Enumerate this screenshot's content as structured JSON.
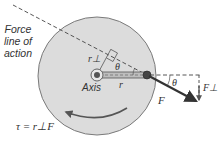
{
  "diagram": {
    "labels": {
      "line_of_action": [
        "Force",
        "line of",
        "action"
      ],
      "axis": "Axis",
      "r_perp": "r⊥",
      "r": "r",
      "theta_inner": "θ",
      "theta_outer": "θ",
      "force": "F",
      "force_perp": "F⊥",
      "equation": "τ = r⊥F"
    },
    "colors": {
      "disk_fill": "#dcdcdc",
      "disk_stroke": "#7a7a7a",
      "line": "#444444",
      "arrow": "#333333",
      "rotation_arrow": "#555555"
    }
  }
}
